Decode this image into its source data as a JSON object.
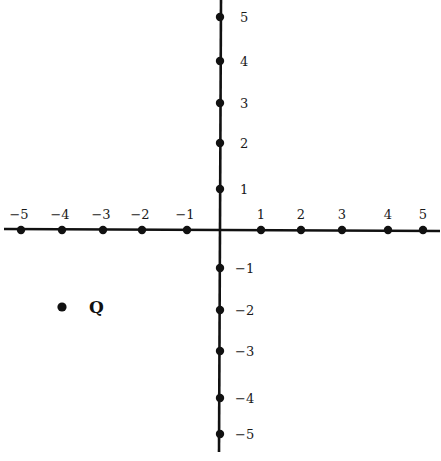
{
  "diagram": {
    "type": "coordinate-plane",
    "axis_color": "#111111",
    "x_axis": {
      "ticks": [
        {
          "value": -5,
          "label": "−5",
          "px": 21
        },
        {
          "value": -4,
          "label": "−4",
          "px": 62
        },
        {
          "value": -3,
          "label": "−3",
          "px": 103
        },
        {
          "value": -2,
          "label": "−2",
          "px": 142
        },
        {
          "value": -1,
          "label": "−1",
          "px": 187
        },
        {
          "value": 1,
          "label": "1",
          "px": 261
        },
        {
          "value": 2,
          "label": "2",
          "px": 301
        },
        {
          "value": 3,
          "label": "3",
          "px": 342
        },
        {
          "value": 4,
          "label": "4",
          "px": 388
        },
        {
          "value": 5,
          "label": "5",
          "px": 423
        }
      ]
    },
    "y_axis": {
      "ticks": [
        {
          "value": 5,
          "label": "5",
          "px": 17
        },
        {
          "value": 4,
          "label": "4",
          "px": 61
        },
        {
          "value": 3,
          "label": "3",
          "px": 103
        },
        {
          "value": 2,
          "label": "2",
          "px": 143
        },
        {
          "value": 1,
          "label": "1",
          "px": 189
        },
        {
          "value": -1,
          "label": "−1",
          "px": 268
        },
        {
          "value": -2,
          "label": "−2",
          "px": 310
        },
        {
          "value": -3,
          "label": "−3",
          "px": 351
        },
        {
          "value": -4,
          "label": "−4",
          "px": 398
        },
        {
          "value": -5,
          "label": "−5",
          "px": 434
        }
      ]
    },
    "points": [
      {
        "name": "Q",
        "label": "Q",
        "x": -4,
        "y": -2
      }
    ]
  }
}
